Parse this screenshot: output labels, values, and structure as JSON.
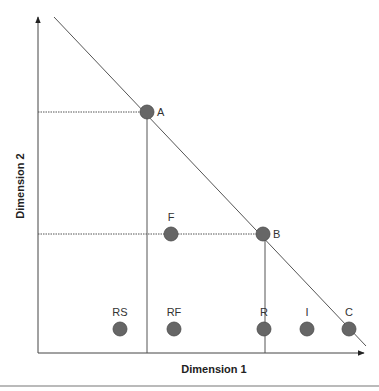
{
  "diagram": {
    "x_axis_label": "Dimension 1",
    "y_axis_label": "Dimension 2",
    "point_color": "#666666",
    "line_color": "#555555",
    "points": [
      {
        "id": "A",
        "label": "A",
        "cx": 147,
        "cy": 112,
        "label_pos": "right"
      },
      {
        "id": "B",
        "label": "B",
        "cx": 263,
        "cy": 234,
        "label_pos": "right"
      },
      {
        "id": "F",
        "label": "F",
        "cx": 171,
        "cy": 234,
        "label_pos": "above"
      },
      {
        "id": "RS",
        "label": "RS",
        "cx": 120,
        "cy": 329,
        "label_pos": "above"
      },
      {
        "id": "RF",
        "label": "RF",
        "cx": 174,
        "cy": 329,
        "label_pos": "above"
      },
      {
        "id": "R",
        "label": "R",
        "cx": 264,
        "cy": 329,
        "label_pos": "above"
      },
      {
        "id": "I",
        "label": "I",
        "cx": 307,
        "cy": 329,
        "label_pos": "above"
      },
      {
        "id": "C",
        "label": "C",
        "cx": 349,
        "cy": 329,
        "label_pos": "above"
      }
    ]
  }
}
